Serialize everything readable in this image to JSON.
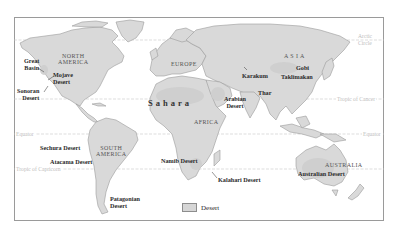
{
  "map": {
    "title": "World Deserts",
    "colors": {
      "land": "#d9d9d9",
      "desert": "#d6d6d6",
      "coast": "#9a9a9a",
      "frame": "#9a9a9a",
      "latitude_line": "#c8c8c8",
      "label": "#2a2a2a"
    },
    "latitude_lines": [
      {
        "name": "Arctic Circle",
        "label_line1": "Arctic",
        "label_line2": "Circle"
      },
      {
        "name": "Tropic of Cancer",
        "label": "Tropic of Cancer"
      },
      {
        "name": "Equator",
        "label_left": "Equator",
        "label_right": "Equator"
      },
      {
        "name": "Tropic of Capricorn",
        "label": "Tropic of Capricorn"
      }
    ],
    "continents": {
      "north_america": {
        "line1": "NORTH",
        "line2": "AMERICA"
      },
      "south_america": {
        "line1": "SOUTH",
        "line2": "AMERICA"
      },
      "europe": "EUROPE",
      "asia": "A S I A",
      "africa": "AFRICA",
      "australia": "AUSTRALIA"
    },
    "deserts": {
      "great_basin": {
        "line1": "Great",
        "line2": "Basin"
      },
      "mojave": {
        "line1": "Mojave",
        "line2": "Desert"
      },
      "sonoran": {
        "line1": "Sonoran",
        "line2": "Desert"
      },
      "sechura": "Sechura Desert",
      "atacama": "Atacama Desert",
      "patagonian": {
        "line1": "Patagonian",
        "line2": "Desert"
      },
      "sahara": "Sahara",
      "arabian": {
        "line1": "Arabian",
        "line2": "Desert"
      },
      "namib": "Namib Desert",
      "kalahari": "Kalahari Desert",
      "karakum": "Karakum",
      "thar": "Thar",
      "gobi": "Gobi",
      "taklimakan": "Taklimakan",
      "australian": "Australian Desert"
    },
    "legend": {
      "label": "Desert"
    }
  }
}
